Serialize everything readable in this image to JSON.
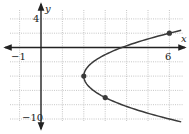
{
  "chart_data": {
    "type": "line",
    "title": "",
    "xlabel": "x",
    "ylabel": "y",
    "xlim": [
      -1.5,
      6.6
    ],
    "ylim": [
      -10.5,
      5
    ],
    "x_grid_step": 1,
    "y_grid_step": 2,
    "grid": true,
    "tick_labels": {
      "x": [
        {
          "value": -1,
          "label": "−1"
        },
        {
          "value": 6,
          "label": "6"
        }
      ],
      "y": [
        {
          "value": 4,
          "label": "4"
        },
        {
          "value": -10,
          "label": "−10"
        }
      ]
    },
    "series": [
      {
        "name": "parabola",
        "equation": "x = (1/9)(y + 4)^2 + 2",
        "vertex": [
          2,
          -4
        ],
        "y_range": [
          -10.4,
          2.4
        ]
      }
    ],
    "points": [
      {
        "x": 6,
        "y": 2
      },
      {
        "x": 2,
        "y": -4
      },
      {
        "x": 3,
        "y": -7
      }
    ]
  },
  "labels": {
    "x_axis": "x",
    "y_axis": "y",
    "x_min_tick": "−1",
    "x_max_tick": "6",
    "y_max_tick": "4",
    "y_min_tick": "−10"
  }
}
